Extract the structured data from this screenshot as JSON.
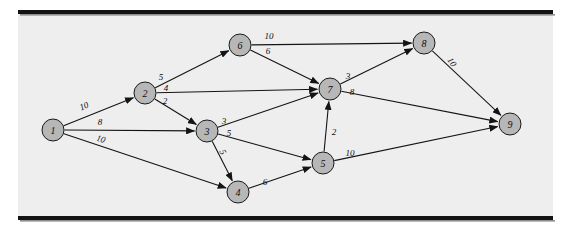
{
  "figure": {
    "node_count": 9,
    "edge_count": 16
  },
  "colors": {
    "node_fill": "#b7b7b7",
    "node_stroke": "#1a1a1a",
    "edge": "#141414",
    "panel": "#eeeeee",
    "rule": "#131313",
    "page": "#ffffff"
  },
  "chart_data": {
    "type": "diagram",
    "subtype": "directed-weighted-graph",
    "title": "",
    "nodes": [
      {
        "id": "1",
        "label": "1",
        "x": 53,
        "y": 130,
        "r": 11
      },
      {
        "id": "2",
        "label": "2",
        "x": 145,
        "y": 93,
        "r": 11
      },
      {
        "id": "3",
        "label": "3",
        "x": 207,
        "y": 131,
        "r": 11
      },
      {
        "id": "4",
        "label": "4",
        "x": 238,
        "y": 192,
        "r": 11
      },
      {
        "id": "5",
        "label": "5",
        "x": 323,
        "y": 163,
        "r": 11
      },
      {
        "id": "6",
        "label": "6",
        "x": 240,
        "y": 45,
        "r": 11
      },
      {
        "id": "7",
        "label": "7",
        "x": 330,
        "y": 89,
        "r": 11
      },
      {
        "id": "8",
        "label": "8",
        "x": 424,
        "y": 43,
        "r": 11
      },
      {
        "id": "9",
        "label": "9",
        "x": 510,
        "y": 124,
        "r": 11
      }
    ],
    "edges": [
      {
        "from": "1",
        "to": "2",
        "weight": "10",
        "lx": 84,
        "ly": 106,
        "rot": -22
      },
      {
        "from": "1",
        "to": "3",
        "weight": "8",
        "lx": 100,
        "ly": 122,
        "rot": 0
      },
      {
        "from": "1",
        "to": "4",
        "weight": "10",
        "lx": 101,
        "ly": 139,
        "rot": 17
      },
      {
        "from": "2",
        "to": "6",
        "weight": "5",
        "lx": 161,
        "ly": 77,
        "rot": 0
      },
      {
        "from": "2",
        "to": "7",
        "weight": "4",
        "lx": 166,
        "ly": 88,
        "rot": 0
      },
      {
        "from": "2",
        "to": "3",
        "weight": "2",
        "lx": 165,
        "ly": 101,
        "rot": 0
      },
      {
        "from": "3",
        "to": "7",
        "weight": "3",
        "lx": 224,
        "ly": 121,
        "rot": 0
      },
      {
        "from": "3",
        "to": "5",
        "weight": "5",
        "lx": 229,
        "ly": 133,
        "rot": 0
      },
      {
        "from": "3",
        "to": "4",
        "weight": "5",
        "lx": 223,
        "ly": 152,
        "rot": 60
      },
      {
        "from": "4",
        "to": "5",
        "weight": "6",
        "lx": 265,
        "ly": 182,
        "rot": 0
      },
      {
        "from": "5",
        "to": "7",
        "weight": "2",
        "lx": 334,
        "ly": 132,
        "rot": 0
      },
      {
        "from": "5",
        "to": "9",
        "weight": "10",
        "lx": 350,
        "ly": 153,
        "rot": 0
      },
      {
        "from": "6",
        "to": "8",
        "weight": "10",
        "lx": 269,
        "ly": 36,
        "rot": 0
      },
      {
        "from": "6",
        "to": "7",
        "weight": "6",
        "lx": 268,
        "ly": 51,
        "rot": 0
      },
      {
        "from": "7",
        "to": "8",
        "weight": "3",
        "lx": 348,
        "ly": 76,
        "rot": 0
      },
      {
        "from": "7",
        "to": "9",
        "weight": "8",
        "lx": 352,
        "ly": 92,
        "rot": 0
      },
      {
        "from": "8",
        "to": "9",
        "weight": "10",
        "lx": 452,
        "ly": 62,
        "rot": 55
      }
    ],
    "layout": {
      "panel": {
        "x": 18,
        "y": 14,
        "w": 535,
        "h": 202
      },
      "top_rule": {
        "x": 18,
        "y": 10,
        "w": 535,
        "h": 4
      },
      "bottom_rule": {
        "x": 18,
        "y": 216,
        "w": 535,
        "h": 4
      }
    }
  }
}
